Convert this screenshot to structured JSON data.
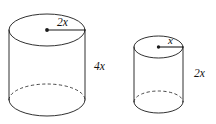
{
  "figure": {
    "background_color": "#ffffff",
    "line_color": "#1a1a1a",
    "shapes": [
      {
        "name": "large-cylinder",
        "radius_label": "2x",
        "height_label": "4x",
        "center_x": 47,
        "left_x": 9,
        "right_x": 85,
        "radius_x": 38,
        "top_center_y": 30,
        "bottom_center_y": 100,
        "ellipse_radius_y": 16,
        "radius_label_x": 57,
        "radius_label_y": 26,
        "height_label_x": 94,
        "height_label_y": 70
      },
      {
        "name": "small-cylinder",
        "radius_label": "x",
        "height_label": "2x",
        "center_x": 158.5,
        "left_x": 134,
        "right_x": 183,
        "radius_x": 24.5,
        "top_center_y": 47,
        "bottom_center_y": 102,
        "ellipse_radius_y": 11,
        "radius_label_x": 168,
        "radius_label_y": 44,
        "height_label_x": 194,
        "height_label_y": 77
      }
    ]
  }
}
